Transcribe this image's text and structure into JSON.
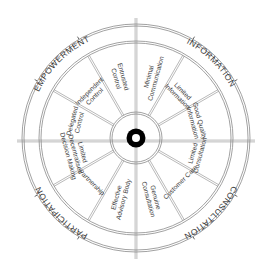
{
  "diagram": {
    "type": "wheel",
    "center": [
      136,
      138
    ],
    "colors": {
      "line": "#8a8a8a",
      "text": "#3a3a3a",
      "hub": "#000000",
      "background": "#ffffff"
    },
    "quadrants": [
      {
        "label": "EMPOWERMENT",
        "mid_angle": -135
      },
      {
        "label": "INFORMATION",
        "mid_angle": -45
      },
      {
        "label": "CONSULTATION",
        "mid_angle": 45
      },
      {
        "label": "PARTICIPATION",
        "mid_angle": 135
      }
    ],
    "segments": [
      {
        "lines": [
          "Entrusted",
          "Control"
        ],
        "angle": -105
      },
      {
        "lines": [
          "Minimal",
          "Communication"
        ],
        "angle": -75
      },
      {
        "lines": [
          "Limited",
          "Information"
        ],
        "angle": -45
      },
      {
        "lines": [
          "Good Quality",
          "Information"
        ],
        "angle": -15
      },
      {
        "lines": [
          "Limited",
          "Consultation"
        ],
        "angle": 15
      },
      {
        "lines": [
          "Customer Care"
        ],
        "angle": 45
      },
      {
        "lines": [
          "Genuine",
          "Consultation"
        ],
        "angle": 75
      },
      {
        "lines": [
          "Effective",
          "Advisory Body"
        ],
        "angle": 105
      },
      {
        "lines": [
          "Partnership"
        ],
        "angle": 135
      },
      {
        "lines": [
          "Limited",
          "Decentralised",
          "Decision Making"
        ],
        "angle": 165
      },
      {
        "lines": [
          "Delegated",
          "Control"
        ],
        "angle": 195
      },
      {
        "lines": [
          "Independent",
          "Control"
        ],
        "angle": 225
      }
    ]
  }
}
